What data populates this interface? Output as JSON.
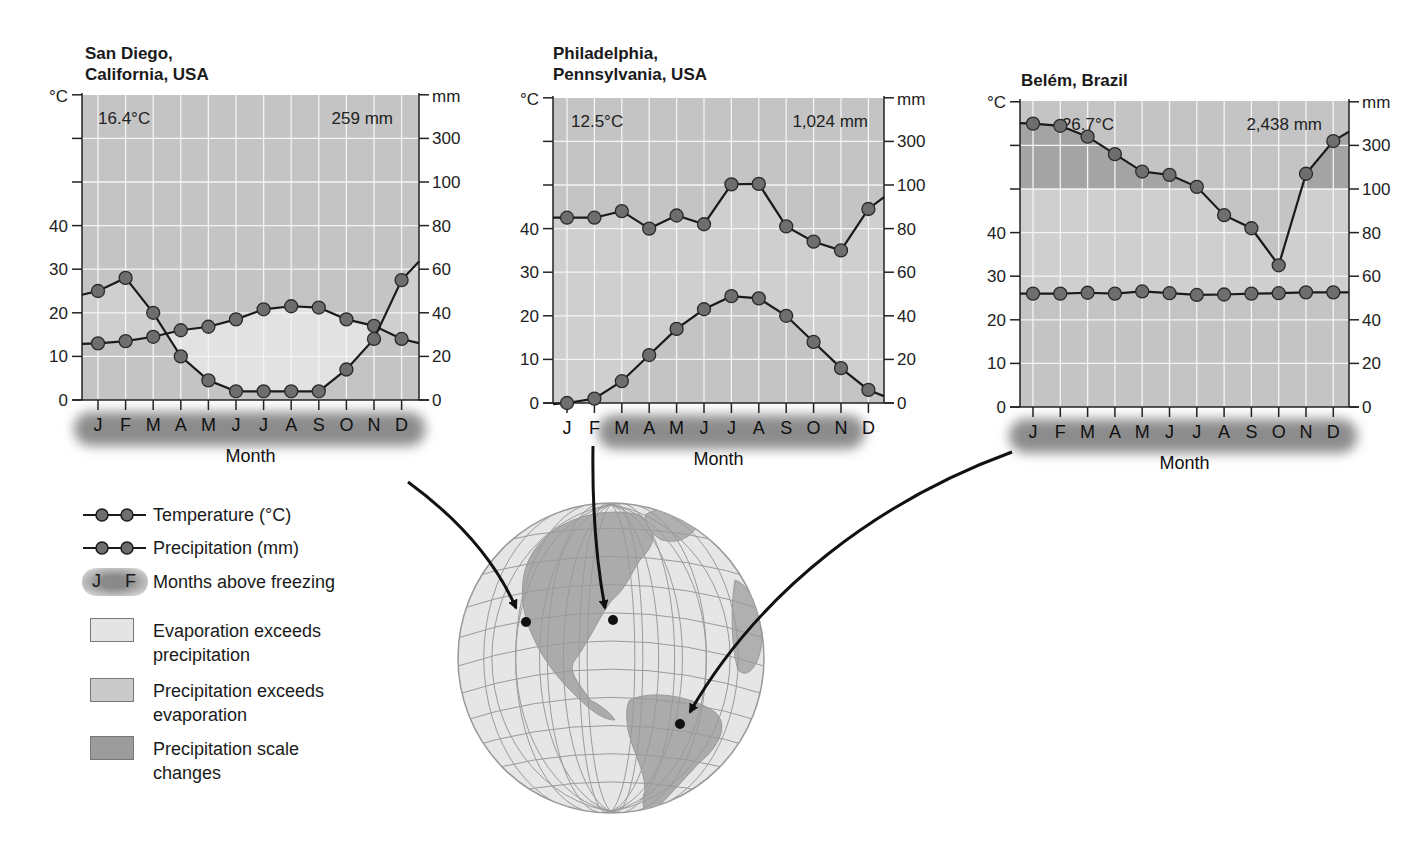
{
  "charts": [
    {
      "title": "San Diego,\nCalifornia, USA",
      "avg_temp": "16.4°C",
      "total_precip": "259 mm"
    },
    {
      "title": "Philadelphia,\nPennsylvania, USA",
      "avg_temp": "12.5°C",
      "total_precip": "1,024 mm"
    },
    {
      "title": "Belém, Brazil",
      "avg_temp": "26.7°C",
      "total_precip": "2,438 mm"
    }
  ],
  "axis": {
    "left_unit": "°C",
    "right_unit": "mm",
    "left_ticks": [
      "0",
      "10",
      "20",
      "30",
      "40"
    ],
    "right_ticks": [
      "0",
      "20",
      "40",
      "60",
      "80",
      "100",
      "300"
    ],
    "xlabel": "Month",
    "months": [
      "J",
      "F",
      "M",
      "A",
      "M",
      "J",
      "J",
      "A",
      "S",
      "O",
      "N",
      "D"
    ]
  },
  "legend": {
    "temperature": "Temperature (°C)",
    "precipitation": "Precipitation (mm)",
    "months_sample": [
      "J",
      "F"
    ],
    "months_above_freezing": "Months above freezing",
    "evap_exceeds_1": "Evaporation exceeds",
    "evap_exceeds_2": "precipitation",
    "precip_exceeds_1": "Precipitation exceeds",
    "precip_exceeds_2": "evaporation",
    "scale_changes_1": "Precipitation scale",
    "scale_changes_2": "changes"
  },
  "colors": {
    "plot_bg": "#c4c4c4",
    "evap_fill": "#e2e2e2",
    "precip_fill": "#cfcfcf",
    "scale_fill": "#a4a4a4",
    "line": "#1a1a1a",
    "marker": "#6e6e6e"
  },
  "chart_data": [
    {
      "type": "line",
      "title": "San Diego, California, USA",
      "categories": [
        "J",
        "F",
        "M",
        "A",
        "M",
        "J",
        "J",
        "A",
        "S",
        "O",
        "N",
        "D"
      ],
      "series": [
        {
          "name": "Temperature (°C)",
          "axis": "left",
          "values": [
            13,
            13.5,
            14.5,
            16,
            16.8,
            18.5,
            20.8,
            21.5,
            21.2,
            18.5,
            17,
            14
          ]
        },
        {
          "name": "Precipitation (mm)",
          "axis": "right",
          "values": [
            50,
            56,
            40,
            20,
            9,
            4,
            4,
            4,
            4,
            14,
            28,
            55
          ]
        }
      ],
      "annotations": [
        "16.4°C",
        "259 mm"
      ],
      "xlabel": "Month",
      "ylabel_left": "°C",
      "ylabel_right": "mm",
      "ylim_left": [
        0,
        40
      ],
      "ylim_right": [
        0,
        300
      ],
      "right_ticks": [
        0,
        20,
        40,
        60,
        80,
        100,
        300
      ],
      "months_above_freezing": [
        "J",
        "F",
        "M",
        "A",
        "M",
        "J",
        "J",
        "A",
        "S",
        "O",
        "N",
        "D"
      ],
      "grid": true
    },
    {
      "type": "line",
      "title": "Philadelphia, Pennsylvania, USA",
      "categories": [
        "J",
        "F",
        "M",
        "A",
        "M",
        "J",
        "J",
        "A",
        "S",
        "O",
        "N",
        "D"
      ],
      "series": [
        {
          "name": "Temperature (°C)",
          "axis": "left",
          "values": [
            0,
            1,
            5,
            11,
            17,
            21.5,
            24.5,
            24,
            20,
            14,
            8,
            3
          ]
        },
        {
          "name": "Precipitation (mm)",
          "axis": "right",
          "values": [
            85,
            85,
            88,
            80,
            86,
            82,
            103,
            105,
            81,
            74,
            70,
            89
          ]
        }
      ],
      "annotations": [
        "12.5°C",
        "1,024 mm"
      ],
      "xlabel": "Month",
      "ylabel_left": "°C",
      "ylabel_right": "mm",
      "ylim_left": [
        0,
        40
      ],
      "ylim_right": [
        0,
        300
      ],
      "right_ticks": [
        0,
        20,
        40,
        60,
        80,
        100,
        300
      ],
      "months_above_freezing": [
        "M",
        "A",
        "M",
        "J",
        "J",
        "A",
        "S",
        "O",
        "N"
      ],
      "grid": true
    },
    {
      "type": "line",
      "title": "Belém, Brazil",
      "categories": [
        "J",
        "F",
        "M",
        "A",
        "M",
        "J",
        "J",
        "A",
        "S",
        "O",
        "N",
        "D"
      ],
      "series": [
        {
          "name": "Temperature (°C)",
          "axis": "left",
          "values": [
            26,
            26,
            26.2,
            26,
            26.5,
            26.1,
            25.7,
            25.8,
            26,
            26.1,
            26.3,
            26.3
          ]
        },
        {
          "name": "Precipitation (mm)",
          "axis": "right",
          "values": [
            350,
            345,
            320,
            260,
            180,
            165,
            110,
            88,
            82,
            65,
            170,
            310
          ]
        }
      ],
      "annotations": [
        "26.7°C",
        "2,438 mm"
      ],
      "xlabel": "Month",
      "ylabel_left": "°C",
      "ylabel_right": "mm",
      "ylim_left": [
        0,
        40
      ],
      "ylim_right": [
        0,
        400
      ],
      "right_ticks": [
        0,
        20,
        40,
        60,
        80,
        100,
        300
      ],
      "months_above_freezing": [
        "J",
        "F",
        "M",
        "A",
        "M",
        "J",
        "J",
        "A",
        "S",
        "O",
        "N",
        "D"
      ],
      "grid": true
    }
  ]
}
